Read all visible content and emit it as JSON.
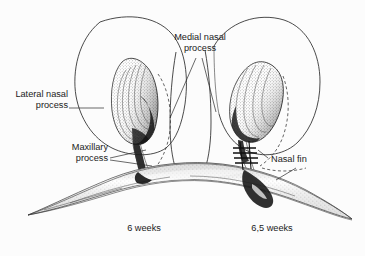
{
  "figure": {
    "background_color": "#fcfcfc",
    "ink_color": "#1b1b1b",
    "style": "black-and-white stippled anatomical line drawing"
  },
  "labels": {
    "lateral_nasal_process": "Lateral nasal\nprocess",
    "lateral_nasal_process_line1": "Lateral nasal",
    "lateral_nasal_process_line2": "process",
    "medial_nasal_process_line1": "Medial nasal",
    "medial_nasal_process_line2": "process",
    "maxillary_process_line1": "Maxillary",
    "maxillary_process_line2": "process",
    "nasal_fin": "Nasal fin"
  },
  "captions": {
    "left_stage": "6 weeks",
    "right_stage": "6,5 weeks"
  },
  "structures": [
    {
      "name": "lateral-nasal-process-left",
      "stage": "6 weeks",
      "description": "rounded lobe outline enclosing the left nasal placode"
    },
    {
      "name": "nasal-placode-left",
      "stage": "6 weeks",
      "description": "stippled teardrop structure with concentric contour ridges"
    },
    {
      "name": "medial-nasal-process",
      "stage": "both",
      "description": "central column between the two lateral lobes"
    },
    {
      "name": "lateral-nasal-process-right",
      "stage": "6,5 weeks",
      "description": "rounded lobe outline enclosing the right nasal placode"
    },
    {
      "name": "nasal-placode-right",
      "stage": "6,5 weeks",
      "description": "elongated tilted stippled structure"
    },
    {
      "name": "maxillary-process",
      "stage": "both",
      "description": "broad stippled arch spanning the lower portion with tapered wings"
    },
    {
      "name": "nasal-fin",
      "stage": "6,5 weeks",
      "description": "ladder-like cross-hatch marking at the fusion groove"
    }
  ]
}
